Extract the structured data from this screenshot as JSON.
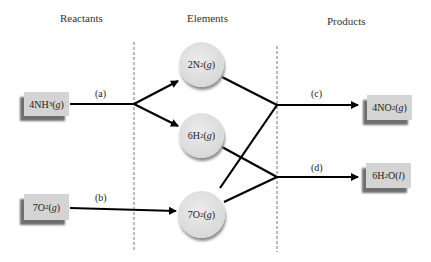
{
  "headers": {
    "reactants": "Reactants",
    "elements": "Elements",
    "products": "Products"
  },
  "reactants": [
    {
      "id": "nh3",
      "coef": "4",
      "formula": "NH",
      "sub": "3",
      "state": "g"
    },
    {
      "id": "o2",
      "coef": "7",
      "formula": "O",
      "sub": "2",
      "state": "g"
    }
  ],
  "elements": [
    {
      "id": "n2",
      "coef": "2",
      "formula": "N",
      "sub": "2",
      "state": "g"
    },
    {
      "id": "h2",
      "coef": "6",
      "formula": "H",
      "sub": "2",
      "state": "g"
    },
    {
      "id": "o2",
      "coef": "7",
      "formula": "O",
      "sub": "2",
      "state": "g"
    }
  ],
  "products": [
    {
      "id": "no2",
      "coef": "4",
      "formula": "NO",
      "sub": "2",
      "tail": "",
      "state": "g"
    },
    {
      "id": "h2o",
      "coef": "6",
      "formula": "H",
      "sub": "2",
      "tail": "O",
      "state": "l"
    }
  ],
  "step_labels": {
    "a": "(a)",
    "b": "(b)",
    "c": "(c)",
    "d": "(d)"
  },
  "colors": {
    "box": "#d4d4d4",
    "box_shadow": "#6e6e6e",
    "circle": "#dcdcdc",
    "line": "#000000",
    "divider": "#777777"
  }
}
